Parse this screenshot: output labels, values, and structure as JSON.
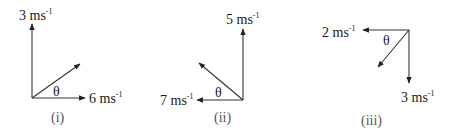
{
  "diagram": {
    "type": "vector_diagrams",
    "line_color": "#333333",
    "text_color": "#1a1a1a",
    "figures": [
      {
        "caption": "(i)",
        "angle_label": "θ",
        "vectors": [
          {
            "name": "vertical",
            "direction": "up",
            "magnitude": "3",
            "unit": "ms",
            "exponent": "-1"
          },
          {
            "name": "horizontal",
            "direction": "right",
            "magnitude": "6",
            "unit": "ms",
            "exponent": "-1"
          },
          {
            "name": "resultant",
            "direction": "up-right",
            "magnitude": "",
            "unit": "",
            "exponent": ""
          }
        ]
      },
      {
        "caption": "(ii)",
        "angle_label": "θ",
        "vectors": [
          {
            "name": "vertical",
            "direction": "up",
            "magnitude": "5",
            "unit": "ms",
            "exponent": "-1"
          },
          {
            "name": "horizontal",
            "direction": "left",
            "magnitude": "7",
            "unit": "ms",
            "exponent": "-1"
          },
          {
            "name": "resultant",
            "direction": "up-left",
            "magnitude": "",
            "unit": "",
            "exponent": ""
          }
        ]
      },
      {
        "caption": "(iii)",
        "angle_label": "θ",
        "vectors": [
          {
            "name": "horizontal",
            "direction": "left",
            "magnitude": "2",
            "unit": "ms",
            "exponent": "-1"
          },
          {
            "name": "vertical",
            "direction": "down",
            "magnitude": "3",
            "unit": "ms",
            "exponent": "-1"
          },
          {
            "name": "resultant",
            "direction": "down-left",
            "magnitude": "",
            "unit": "",
            "exponent": ""
          }
        ]
      }
    ]
  }
}
